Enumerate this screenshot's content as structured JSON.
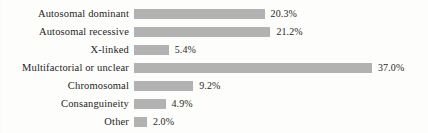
{
  "chart_data": {
    "type": "bar",
    "orientation": "horizontal",
    "title": "",
    "subtitle": "",
    "xlabel": "",
    "ylabel": "",
    "grid": false,
    "axis_visible": false,
    "legend": false,
    "legend_position": "none",
    "xlim": [
      0,
      37
    ],
    "bar_color": "#b2b2b2",
    "text_color": "#26241f",
    "background_color": "#fdfdfb",
    "value_suffix": "%",
    "categories": [
      "Autosomal dominant",
      "Autosomal recessive",
      "X-linked",
      "Multifactorial or unclear",
      "Chromosomal",
      "Consanguineity",
      "Other"
    ],
    "values": [
      20.3,
      21.2,
      5.4,
      37.0,
      9.2,
      4.9,
      2.0
    ],
    "value_labels": [
      "20.3%",
      "21.2%",
      "5.4%",
      "37.0%",
      "9.2%",
      "4.9%",
      "2.0%"
    ],
    "bars": [
      {
        "label": "Autosomal dominant",
        "value": 20.3,
        "value_label": "20.3%"
      },
      {
        "label": "Autosomal recessive",
        "value": 21.2,
        "value_label": "21.2%"
      },
      {
        "label": "X-linked",
        "value": 5.4,
        "value_label": "5.4%"
      },
      {
        "label": "Multifactorial or unclear",
        "value": 37.0,
        "value_label": "37.0%"
      },
      {
        "label": "Chromosomal",
        "value": 9.2,
        "value_label": "9.2%"
      },
      {
        "label": "Consanguineity",
        "value": 4.9,
        "value_label": "4.9%"
      },
      {
        "label": "Other",
        "value": 2.0,
        "value_label": "2.0%"
      }
    ]
  }
}
